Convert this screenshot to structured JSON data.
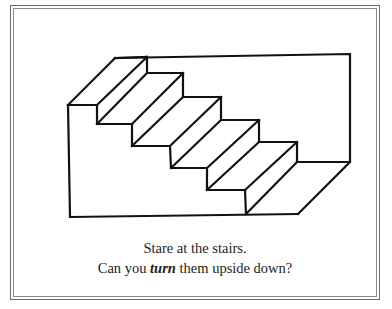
{
  "illustration": {
    "name": "Impossible staircase (Schroeder stairs) optical illusion",
    "stroke_color": "#111111",
    "frame_color": "#6a6a6a"
  },
  "caption": {
    "line1": "Stare at the stairs.",
    "line2_before": "Can you ",
    "line2_emphasis": "turn",
    "line2_after": " them upside down?"
  }
}
